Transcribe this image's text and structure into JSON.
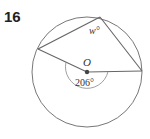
{
  "problem": {
    "number": "16"
  },
  "diagram": {
    "center_label": "O",
    "central_angle_label": "206°",
    "inscribed_angle_label": "w°",
    "line_color": "#666666",
    "point_color": "#444444"
  }
}
